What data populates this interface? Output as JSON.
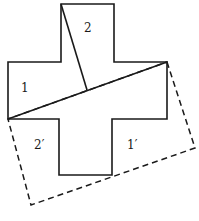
{
  "diagram": {
    "labels": {
      "piece_2": "2",
      "piece_1": "1",
      "piece_2_prime": "2′",
      "piece_1_prime": "1′"
    },
    "colors": {
      "stroke": "#1a1a1a",
      "background": "#ffffff"
    }
  }
}
